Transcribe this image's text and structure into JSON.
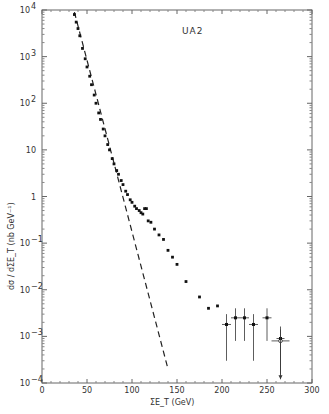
{
  "chart_data": {
    "type": "scatter",
    "title": "",
    "annotation": "UA2",
    "xlabel": "ΣE_T  (GeV)",
    "ylabel": "dσ / dΣE_T  (nb GeV⁻¹)",
    "xlim": [
      0,
      300
    ],
    "ylim": [
      0.0001,
      10000
    ],
    "yscale": "log",
    "grid": false,
    "x_ticks": [
      0,
      50,
      100,
      150,
      200,
      250,
      300
    ],
    "x_tick_labels": [
      "0",
      "50",
      "100",
      "150",
      "200",
      "250",
      "300"
    ],
    "y_ticks": [
      10000,
      1000,
      100,
      10,
      1,
      0.1,
      0.01,
      0.001,
      0.0001
    ],
    "y_tick_labels": [
      "10^4",
      "10^3",
      "10^2",
      "10",
      "1",
      "10^-1",
      "10^-2",
      "10^-3",
      "10^-4"
    ],
    "series": [
      {
        "name": "UA2 data",
        "style": "points",
        "x": [
          36,
          38,
          40,
          42,
          45,
          48,
          50,
          53,
          55,
          58,
          60,
          63,
          65,
          68,
          70,
          73,
          75,
          78,
          80,
          83,
          85,
          88,
          90,
          93,
          95,
          98,
          100,
          103,
          105,
          108,
          110,
          112,
          114,
          116,
          118,
          121,
          125,
          130,
          135,
          140,
          145,
          150,
          160,
          175,
          185,
          195
        ],
        "y": [
          8000,
          5500,
          4000,
          2800,
          1500,
          900,
          600,
          380,
          250,
          150,
          100,
          62,
          45,
          28,
          20,
          13,
          10,
          6.5,
          5,
          3.6,
          3,
          2.2,
          1.8,
          1.3,
          1.1,
          0.85,
          0.75,
          0.62,
          0.55,
          0.5,
          0.45,
          0.42,
          0.55,
          0.55,
          0.3,
          0.28,
          0.2,
          0.15,
          0.12,
          0.07,
          0.05,
          0.035,
          0.015,
          0.007,
          0.004,
          0.0045
        ]
      },
      {
        "name": "UA2 high-ΣE_T bins (with error bars)",
        "style": "points-errorbars",
        "x": [
          205,
          215,
          225,
          235,
          250,
          265
        ],
        "y": [
          0.0018,
          0.0025,
          0.0025,
          0.0018,
          0.0025,
          0.0008
        ],
        "y_err_low": [
          0.0015,
          0.0017,
          0.0017,
          0.0015,
          0.0017,
          0.00065
        ],
        "y_err_high": [
          0.0012,
          0.0015,
          0.0015,
          0.0012,
          0.0015,
          0.0006
        ],
        "x_err": [
          5,
          5,
          5,
          5,
          5,
          10
        ],
        "markers": [
          "filled",
          "filled",
          "filled",
          "filled",
          "filled",
          "open"
        ]
      },
      {
        "name": "Upper limit",
        "style": "arrow",
        "x": [
          265
        ],
        "y": [
          0.0009
        ],
        "y_low": [
          0.00012
        ]
      },
      {
        "name": "Extrapolation (dashed)",
        "style": "dashed-line",
        "x": [
          36,
          140
        ],
        "y": [
          9000,
          0.0002
        ]
      }
    ]
  }
}
